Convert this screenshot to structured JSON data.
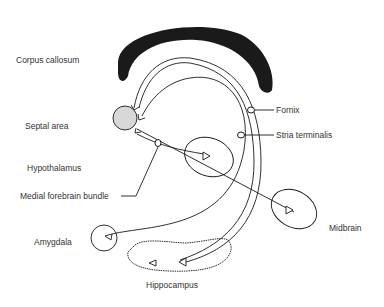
{
  "diagram": {
    "type": "neuroanatomy-pathways",
    "labels": {
      "corpus_callosum": "Corpus callosum",
      "septal_area": "Septal area",
      "fornix": "Fornix",
      "stria_terminalis": "Stria terminalis",
      "hypothalamus": "Hypothalamus",
      "medial_forebrain_bundle": "Medial forebrain bundle",
      "midbrain": "Midbrain",
      "amygdala": "Amygdala",
      "hippocampus": "Hippocampus"
    },
    "colors": {
      "stroke": "#1a1a1a",
      "corpus_callosum_fill": "#1a1a1a",
      "septal_fill": "#d8d8d8",
      "text": "#333333"
    }
  }
}
